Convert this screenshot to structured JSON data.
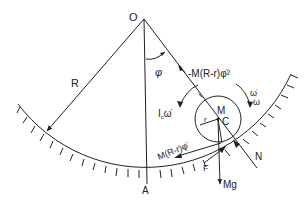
{
  "diagram": {
    "points": {
      "origin": "O",
      "bottom": "A",
      "mass_label": "M",
      "center": "C"
    },
    "dimensions": {
      "track_radius": "R",
      "cylinder_radius": "r",
      "angle": "φ"
    },
    "forces": {
      "centrifugal": "-M(R-r)φ̇²",
      "tangential_inertia": "M(R-r)φ̈",
      "rotational_inertia_prefix": "I",
      "rotational_inertia_sub": "c",
      "rotational_inertia_suffix": "ω̇",
      "angular_velocity_top": "ω̇",
      "angular_velocity_bottom": "ω",
      "normal": "N",
      "friction": "F",
      "weight": "Mg"
    },
    "colors": {
      "ink": "#222222",
      "background": "#ffffff"
    }
  }
}
